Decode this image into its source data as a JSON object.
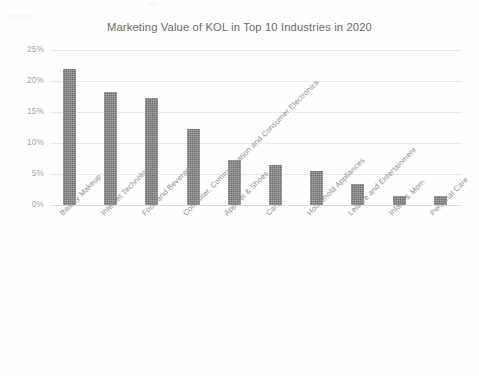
{
  "chart_data": {
    "type": "bar",
    "title": "Marketing Value of KOL in Top 10 Industries in 2020",
    "xlabel": "",
    "ylabel": "",
    "ylim": [
      0,
      25
    ],
    "ytick_labels": [
      "0%",
      "5%",
      "10%",
      "15%",
      "20%",
      "25%"
    ],
    "ytick_values": [
      0,
      5,
      10,
      15,
      20,
      25
    ],
    "grid": true,
    "legend": "none",
    "value_suffix": "%",
    "bar_color": "#6f6f6f",
    "gridline_color": "#e9e9e9",
    "categories": [
      "Beauty Makeup",
      "Internet Technology",
      "Food and Beverage",
      "Computer, Communication and Consumer Electronics",
      "Apparel & Shoes",
      "Cars",
      "Household Appliances",
      "Leisure and Entertainment",
      "Infant & Mom",
      "Personal Care"
    ],
    "values": [
      22.0,
      18.2,
      17.2,
      12.3,
      7.2,
      6.4,
      5.5,
      3.4,
      1.4,
      1.4
    ]
  }
}
